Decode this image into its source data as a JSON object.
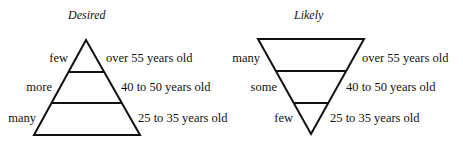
{
  "diagrams": [
    {
      "title": "Desired",
      "shape": "upright-triangle",
      "levels": [
        {
          "quantity": "few",
          "age_group": "over 55 years old"
        },
        {
          "quantity": "more",
          "age_group": "40 to 50 years old"
        },
        {
          "quantity": "many",
          "age_group": "25 to 35 years old"
        }
      ]
    },
    {
      "title": "Likely",
      "shape": "inverted-triangle",
      "levels": [
        {
          "quantity": "many",
          "age_group": "over 55 years old"
        },
        {
          "quantity": "some",
          "age_group": "40 to 50 years old"
        },
        {
          "quantity": "few",
          "age_group": "25 to 35 years old"
        }
      ]
    }
  ]
}
